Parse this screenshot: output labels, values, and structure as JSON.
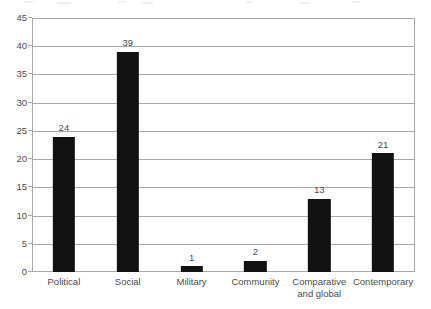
{
  "chart_data": {
    "type": "bar",
    "title": "",
    "subtitle": "",
    "xlabel": "",
    "ylabel": "",
    "categories": [
      "Political",
      "Social",
      "Military",
      "Community",
      "Comparative and global",
      "Contemporary"
    ],
    "category_lines": [
      [
        "Political"
      ],
      [
        "Social"
      ],
      [
        "Military"
      ],
      [
        "Community"
      ],
      [
        "Comparative",
        "and global"
      ],
      [
        "Contemporary"
      ]
    ],
    "values": [
      24,
      39,
      1,
      2,
      13,
      21
    ],
    "data_labels": [
      "24",
      "39",
      "1",
      "2",
      "13",
      "21"
    ],
    "ylim": [
      0,
      45
    ],
    "y_ticks": [
      0,
      5,
      10,
      15,
      20,
      25,
      30,
      35,
      40,
      45
    ],
    "y_tick_labels": [
      "0",
      "5",
      "10",
      "15",
      "20",
      "25",
      "30",
      "35",
      "40",
      "45"
    ],
    "grid": true,
    "grid_axis": "y",
    "legend": false,
    "legend_position": "none",
    "bar_color": "#121212",
    "grid_color": "#a9a9ad",
    "axis_color": "#a9a9ad",
    "text_color": "#4b4b50",
    "background_color": "#ffffff"
  }
}
